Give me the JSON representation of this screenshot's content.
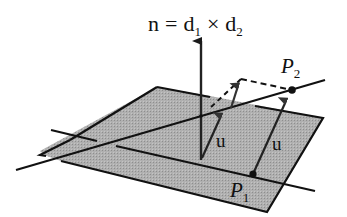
{
  "diagram": {
    "formula": {
      "lhs": "n",
      "eq": "=",
      "d1": "d",
      "d1_sub": "1",
      "cross": "×",
      "d2": "d",
      "d2_sub": "2"
    },
    "points": {
      "p1": {
        "label": "P",
        "sub": "1"
      },
      "p2": {
        "label": "P",
        "sub": "2"
      }
    },
    "vectors": {
      "u_left": "u",
      "u_right": "u",
      "normal": "n"
    },
    "colors": {
      "plane_fill": "#a9a9a9",
      "line": "#111111",
      "background": "#ffffff"
    }
  }
}
